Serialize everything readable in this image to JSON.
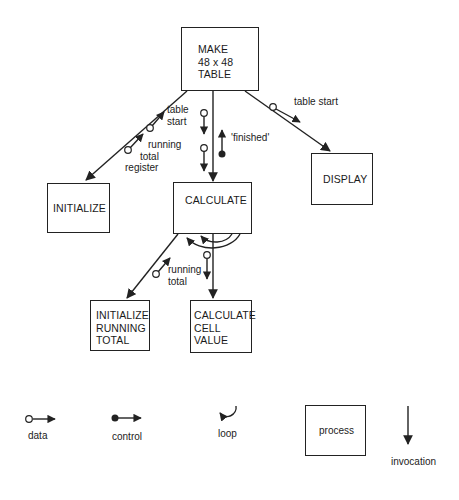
{
  "diagram": {
    "processes": {
      "make_table": {
        "lines": [
          "MAKE",
          "48 x 48",
          "TABLE"
        ]
      },
      "initialize": {
        "label": "INITIALIZE"
      },
      "calculate": {
        "label": "CALCULATE"
      },
      "display": {
        "label": "DISPLAY"
      },
      "initialize_running_total": {
        "lines": [
          "INITIALIZE",
          "RUNNING",
          "TOTAL"
        ]
      },
      "calculate_cell_value": {
        "lines": [
          "CALCULATE",
          "CELL",
          "VALUE"
        ]
      }
    },
    "flow_labels": {
      "table_start_left": [
        "table",
        "start"
      ],
      "running_total_register": [
        "running",
        "total",
        "register"
      ],
      "finished": "'finished'",
      "table_start_right": "table start",
      "running_total_bottom": [
        "running",
        "total"
      ]
    }
  },
  "legend": {
    "data": "data",
    "control": "control",
    "loop": "loop",
    "process": "process",
    "invocation": "invocation"
  },
  "colors": {
    "ink": "#222222",
    "background": "#ffffff"
  }
}
